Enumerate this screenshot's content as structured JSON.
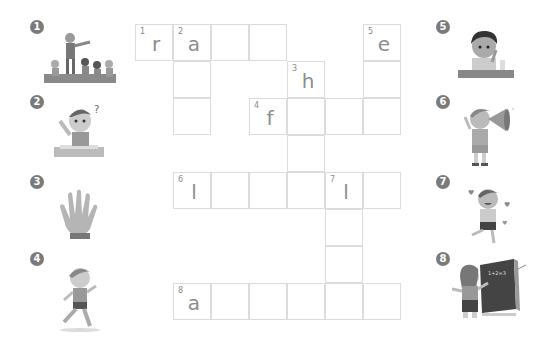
{
  "puzzle": {
    "type": "crossword",
    "cell_size": {
      "w": 38,
      "h": 37
    },
    "origin": {
      "x": 135,
      "y": 24
    },
    "cells": [
      {
        "r": 0,
        "c": 0,
        "num": "1",
        "letter": "r"
      },
      {
        "r": 0,
        "c": 1,
        "num": "2",
        "letter": "a"
      },
      {
        "r": 0,
        "c": 2,
        "num": "",
        "letter": ""
      },
      {
        "r": 0,
        "c": 3,
        "num": "",
        "letter": ""
      },
      {
        "r": 0,
        "c": 6,
        "num": "5",
        "letter": "e"
      },
      {
        "r": 1,
        "c": 1,
        "num": "",
        "letter": ""
      },
      {
        "r": 1,
        "c": 4,
        "num": "3",
        "letter": "h"
      },
      {
        "r": 1,
        "c": 6,
        "num": "",
        "letter": ""
      },
      {
        "r": 2,
        "c": 1,
        "num": "",
        "letter": ""
      },
      {
        "r": 2,
        "c": 3,
        "num": "4",
        "letter": "f"
      },
      {
        "r": 2,
        "c": 4,
        "num": "",
        "letter": ""
      },
      {
        "r": 2,
        "c": 5,
        "num": "",
        "letter": ""
      },
      {
        "r": 2,
        "c": 6,
        "num": "",
        "letter": ""
      },
      {
        "r": 3,
        "c": 4,
        "num": "",
        "letter": ""
      },
      {
        "r": 4,
        "c": 1,
        "num": "6",
        "letter": "l"
      },
      {
        "r": 4,
        "c": 2,
        "num": "",
        "letter": ""
      },
      {
        "r": 4,
        "c": 3,
        "num": "",
        "letter": ""
      },
      {
        "r": 4,
        "c": 4,
        "num": "",
        "letter": ""
      },
      {
        "r": 4,
        "c": 5,
        "num": "7",
        "letter": "l"
      },
      {
        "r": 4,
        "c": 6,
        "num": "",
        "letter": ""
      },
      {
        "r": 5,
        "c": 5,
        "num": "",
        "letter": ""
      },
      {
        "r": 6,
        "c": 5,
        "num": "",
        "letter": ""
      },
      {
        "r": 7,
        "c": 1,
        "num": "8",
        "letter": "a"
      },
      {
        "r": 7,
        "c": 2,
        "num": "",
        "letter": ""
      },
      {
        "r": 7,
        "c": 3,
        "num": "",
        "letter": ""
      },
      {
        "r": 7,
        "c": 4,
        "num": "",
        "letter": ""
      },
      {
        "r": 7,
        "c": 5,
        "num": "",
        "letter": ""
      },
      {
        "r": 7,
        "c": 6,
        "num": "",
        "letter": ""
      }
    ]
  },
  "clues": [
    {
      "num": "1",
      "icon": "teacher-running-kids-icon",
      "side": "left",
      "x": 28,
      "y": 18
    },
    {
      "num": "2",
      "icon": "boy-raising-hand-icon",
      "side": "left",
      "x": 28,
      "y": 93
    },
    {
      "num": "3",
      "icon": "hand-icon",
      "side": "left",
      "x": 28,
      "y": 173
    },
    {
      "num": "4",
      "icon": "girl-running-icon",
      "side": "left",
      "x": 28,
      "y": 250
    },
    {
      "num": "5",
      "icon": "boy-eating-icon",
      "side": "right",
      "x": 434,
      "y": 18
    },
    {
      "num": "6",
      "icon": "boy-megaphone-icon",
      "side": "right",
      "x": 434,
      "y": 93
    },
    {
      "num": "7",
      "icon": "boy-laughing-icon",
      "side": "right",
      "x": 434,
      "y": 173
    },
    {
      "num": "8",
      "icon": "girl-at-blackboard-icon",
      "side": "right",
      "x": 434,
      "y": 250
    }
  ]
}
